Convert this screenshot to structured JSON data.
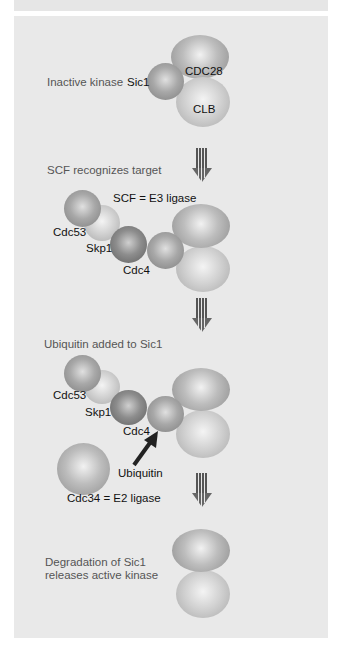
{
  "diagram": {
    "steps": [
      {
        "label": "Inactive kinase",
        "proteins": {
          "sic1": "Sic1",
          "cdc28": "CDC28",
          "clb": "CLB"
        }
      },
      {
        "label": "SCF recognizes target",
        "complex_label": "SCF = E3 ligase",
        "proteins": {
          "cdc53": "Cdc53",
          "skp1": "Skp1",
          "cdc4": "Cdc4"
        }
      },
      {
        "label": "Ubiquitin added to Sic1",
        "proteins": {
          "cdc53": "Cdc53",
          "skp1": "Skp1",
          "cdc4": "Cdc4",
          "ubiquitin": "Ubiquitin"
        },
        "e2_label": "Cdc34 = E2 ligase"
      },
      {
        "label_line1": "Degradation of Sic1",
        "label_line2": "releases active kinase"
      }
    ],
    "colors": {
      "panel": "#e9e9e9",
      "text": "#555555",
      "protein_text": "#111111",
      "arrow": "#555555"
    }
  }
}
